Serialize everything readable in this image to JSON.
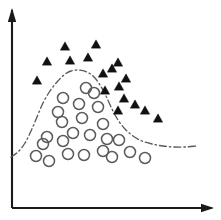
{
  "figure": {
    "title": "",
    "background_color": "#ffffff",
    "width": 221,
    "height": 220
  },
  "axes": {
    "origin": {
      "x": 12,
      "y": 208
    },
    "x_axis": {
      "label": "",
      "start_x": 12,
      "end_x": 212,
      "y": 208,
      "arrowhead": true,
      "color": "#1a1a1a"
    },
    "y_axis": {
      "label": "",
      "x": 12,
      "start_y": 208,
      "end_y": 10,
      "arrowhead": true,
      "color": "#1a1a1a"
    }
  },
  "boundary": {
    "name": "decision-boundary",
    "style": "dash-dot",
    "dash_pattern": "7 3 1.5 3",
    "color": "#595959",
    "width": 1.35,
    "path_points": [
      [
        11,
        157
      ],
      [
        18,
        152
      ],
      [
        25,
        143
      ],
      [
        31,
        131
      ],
      [
        37,
        117
      ],
      [
        43,
        103
      ],
      [
        50,
        91
      ],
      [
        57,
        82
      ],
      [
        64,
        75
      ],
      [
        71,
        71
      ],
      [
        79,
        70
      ],
      [
        87,
        72
      ],
      [
        94,
        77
      ],
      [
        100,
        85
      ],
      [
        106,
        96
      ],
      [
        112,
        109
      ],
      [
        118,
        120
      ],
      [
        125,
        129
      ],
      [
        133,
        136
      ],
      [
        142,
        141
      ],
      [
        152,
        144
      ],
      [
        163,
        146
      ],
      [
        174,
        147
      ],
      [
        185,
        147
      ],
      [
        196,
        146
      ]
    ]
  },
  "chart_data": {
    "type": "scatter",
    "title": "",
    "xlabel": "",
    "ylabel": "",
    "grid": false,
    "legend_position": "none",
    "xlim": [
      12,
      212
    ],
    "ylim": [
      208,
      10
    ],
    "annotations": [
      {
        "name": "decision-boundary",
        "type": "curve",
        "style": "dash-dot"
      }
    ],
    "series": [
      {
        "name": "Class A",
        "marker": "triangle",
        "marker_style": "filled",
        "color": "#111111",
        "marker_size": 9,
        "count": 17,
        "points": [
          [
            65,
            46
          ],
          [
            96,
            44
          ],
          [
            47,
            61
          ],
          [
            70,
            60
          ],
          [
            88,
            57
          ],
          [
            112,
            68
          ],
          [
            103,
            73
          ],
          [
            118,
            62
          ],
          [
            37,
            80
          ],
          [
            119,
            86
          ],
          [
            105,
            90
          ],
          [
            126,
            78
          ],
          [
            124,
            98
          ],
          [
            135,
            104
          ],
          [
            118,
            110
          ],
          [
            145,
            110
          ],
          [
            158,
            118
          ]
        ]
      },
      {
        "name": "Class B",
        "marker": "circle",
        "marker_style": "open",
        "color": "#5a5a5a",
        "marker_size": 11,
        "count": 24,
        "points": [
          [
            86,
            88
          ],
          [
            63,
            98
          ],
          [
            98,
            107
          ],
          [
            62,
            122
          ],
          [
            82,
            118
          ],
          [
            103,
            124
          ],
          [
            43,
            144
          ],
          [
            63,
            141
          ],
          [
            90,
            135
          ],
          [
            68,
            154
          ],
          [
            36,
            156
          ],
          [
            49,
            161
          ],
          [
            84,
            155
          ],
          [
            103,
            151
          ],
          [
            119,
            140
          ],
          [
            112,
            157
          ],
          [
            130,
            152
          ],
          [
            145,
            158
          ],
          [
            47,
            137
          ],
          [
            73,
            133
          ],
          [
            58,
            112
          ],
          [
            79,
            104
          ],
          [
            94,
            93
          ],
          [
            107,
            139
          ]
        ]
      }
    ]
  }
}
